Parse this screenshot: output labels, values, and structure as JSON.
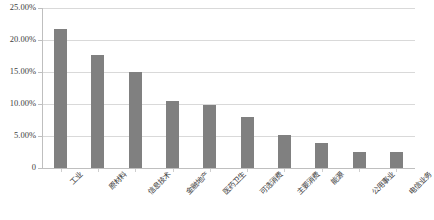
{
  "chart_data": {
    "type": "bar",
    "title": "",
    "subtitle": "",
    "xlabel": "",
    "ylabel": "",
    "ylim": [
      0,
      0.25
    ],
    "grid": true,
    "legend": "none",
    "orientation": "vertical",
    "bar_color": "#808080",
    "gridline_color": "#d9d9d9",
    "axis_color": "#bfbfbf",
    "categories": [
      "工业",
      "原材料",
      "信息技术",
      "金融地产",
      "医药卫生",
      "可选消费",
      "主要消费",
      "能源",
      "公用事业",
      "电信业务"
    ],
    "values": [
      21.7,
      17.7,
      15.0,
      10.5,
      9.8,
      8.0,
      5.2,
      3.9,
      2.5,
      2.5
    ],
    "value_unit": "%",
    "ytick_values": [
      25.0,
      20.0,
      15.0,
      10.0,
      5.0,
      0
    ],
    "ytick_labels": [
      "25.00%",
      "20.00%",
      "15.00%",
      "10.00%",
      "5.00%",
      "0"
    ]
  }
}
